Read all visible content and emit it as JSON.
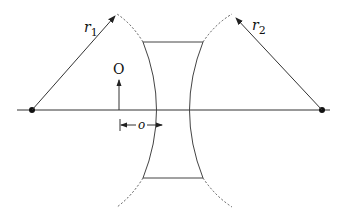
{
  "diagram": {
    "labels": {
      "r1": "r",
      "r1_sub": "1",
      "r2": "r",
      "r2_sub": "2",
      "object": "O",
      "object_distance": "o"
    },
    "colors": {
      "line": "#333333",
      "background": "#ffffff"
    },
    "elements": {
      "optical_axis": {
        "x1": 17,
        "x2": 330,
        "y": 110
      },
      "center_left": {
        "x": 32,
        "y": 110
      },
      "center_right": {
        "x": 322,
        "y": 110
      },
      "lens_top_y": 42,
      "lens_bottom_y": 178
    }
  }
}
